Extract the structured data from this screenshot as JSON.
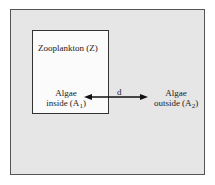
{
  "diagram": {
    "outer_box": {
      "fill": "#e6e6e6",
      "border": "#555555"
    },
    "inner_box": {
      "fill": "#fbfbfb",
      "border": "#333333"
    },
    "zooplankton_label": "Zooplankton (Z)",
    "algae_inside": {
      "line1": "Algae",
      "line2_prefix": "inside (A",
      "subscript": "1",
      "line2_suffix": ")"
    },
    "algae_outside": {
      "line1": "Algae",
      "line2_prefix": "outside (A",
      "subscript": "2",
      "line2_suffix": ")"
    },
    "arrow": {
      "label": "d",
      "type": "bidirectional",
      "color": "#111111"
    }
  }
}
